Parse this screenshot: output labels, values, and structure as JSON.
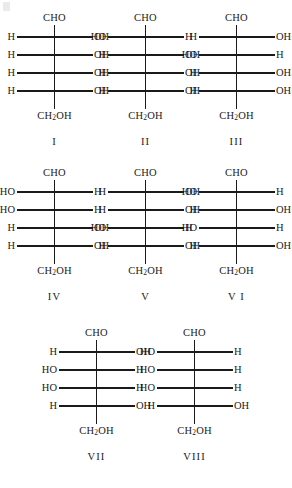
{
  "figure": {
    "type": "fischer-projection-set",
    "background_color": "#ffffff",
    "ink_color": "#1a1a1a",
    "top_group": "CHO",
    "bottom_group_prefix": "CH",
    "bottom_group_subscript": "2",
    "bottom_group_suffix": "OH",
    "stereocenter_count": 4,
    "rows": [
      {
        "structures": [
          "I",
          "II",
          "III"
        ]
      },
      {
        "structures": [
          "IV",
          "V",
          "VI"
        ]
      },
      {
        "structures": [
          "VII",
          "VIII"
        ]
      }
    ]
  },
  "structures": [
    {
      "label": "I",
      "top": "CHO",
      "bottom_prefix": "CH",
      "bottom_sub": "2",
      "bottom_suffix": "OH",
      "centers": [
        {
          "left": "H",
          "right": "OH"
        },
        {
          "left": "H",
          "right": "OH"
        },
        {
          "left": "H",
          "right": "OH"
        },
        {
          "left": "H",
          "right": "OH"
        }
      ]
    },
    {
      "label": "II",
      "top": "CHO",
      "bottom_prefix": "CH",
      "bottom_sub": "2",
      "bottom_suffix": "OH",
      "centers": [
        {
          "left": "HO",
          "right": "H"
        },
        {
          "left": "H",
          "right": "OH"
        },
        {
          "left": "H",
          "right": "OH"
        },
        {
          "left": "H",
          "right": "OH"
        }
      ]
    },
    {
      "label": "III",
      "top": "CHO",
      "bottom_prefix": "CH",
      "bottom_sub": "2",
      "bottom_suffix": "OH",
      "centers": [
        {
          "left": "H",
          "right": "OH"
        },
        {
          "left": "HO",
          "right": "H"
        },
        {
          "left": "H",
          "right": "OH"
        },
        {
          "left": "H",
          "right": "OH"
        }
      ]
    },
    {
      "label": "IV",
      "top": "CHO",
      "bottom_prefix": "CH",
      "bottom_sub": "2",
      "bottom_suffix": "OH",
      "centers": [
        {
          "left": "HO",
          "right": "H"
        },
        {
          "left": "HO",
          "right": "H"
        },
        {
          "left": "H",
          "right": "OH"
        },
        {
          "left": "H",
          "right": "OH"
        }
      ]
    },
    {
      "label": "V",
      "top": "CHO",
      "bottom_prefix": "CH",
      "bottom_sub": "2",
      "bottom_suffix": "OH",
      "centers": [
        {
          "left": "H",
          "right": "OH"
        },
        {
          "left": "H",
          "right": "OH"
        },
        {
          "left": "HO",
          "right": "H"
        },
        {
          "left": "H",
          "right": "OH"
        }
      ]
    },
    {
      "label": "V I",
      "top": "CHO",
      "bottom_prefix": "CH",
      "bottom_sub": "2",
      "bottom_suffix": "OH",
      "centers": [
        {
          "left": "HO",
          "right": "H"
        },
        {
          "left": "H",
          "right": "OH"
        },
        {
          "left": "HO",
          "right": "H"
        },
        {
          "left": "H",
          "right": "OH"
        }
      ]
    },
    {
      "label": "VII",
      "top": "CHO",
      "bottom_prefix": "CH",
      "bottom_sub": "2",
      "bottom_suffix": "OH",
      "centers": [
        {
          "left": "H",
          "right": "OH"
        },
        {
          "left": "HO",
          "right": "H"
        },
        {
          "left": "HO",
          "right": "H"
        },
        {
          "left": "H",
          "right": "OH"
        }
      ]
    },
    {
      "label": "VIII",
      "top": "CHO",
      "bottom_prefix": "CH",
      "bottom_sub": "2",
      "bottom_suffix": "OH",
      "centers": [
        {
          "left": "HO",
          "right": "H"
        },
        {
          "left": "HO",
          "right": "H"
        },
        {
          "left": "HO",
          "right": "H"
        },
        {
          "left": "H",
          "right": "OH"
        }
      ]
    }
  ]
}
